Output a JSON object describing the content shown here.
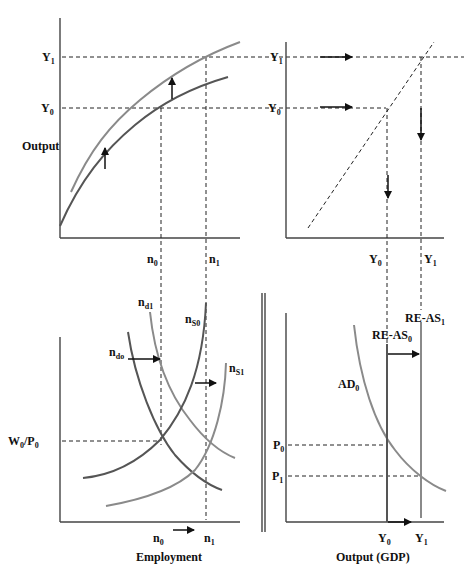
{
  "panels": {
    "production_function": {
      "y_axis_label": "Output",
      "y_ticks": [
        {
          "main": "Y",
          "sub": "1"
        },
        {
          "main": "Y",
          "sub": "0"
        }
      ],
      "x_ticks": [
        {
          "main": "n",
          "sub": "0"
        },
        {
          "main": "n",
          "sub": "1"
        }
      ],
      "curves": [
        "production function (initial)",
        "production function (shifted up)"
      ]
    },
    "forty_five_degree": {
      "y_ticks": [
        {
          "main": "Y",
          "sub": "1"
        },
        {
          "main": "Y",
          "sub": "0"
        }
      ],
      "x_ticks": [
        {
          "main": "Y",
          "sub": "0"
        },
        {
          "main": "Y",
          "sub": "1"
        }
      ]
    },
    "labor_market": {
      "x_axis_label": "Employment",
      "y_ticks": [
        {
          "main": "W",
          "sub": "0",
          "main2": "/P",
          "sub2": "0"
        }
      ],
      "x_ticks": [
        {
          "main": "n",
          "sub": "0"
        },
        {
          "main": "n",
          "sub": "1"
        }
      ],
      "curve_labels": {
        "nd0": {
          "main": "n",
          "sub": "do"
        },
        "nd1": {
          "main": "n",
          "sub": "d1"
        },
        "ns0": {
          "main": "n",
          "sub": "S0"
        },
        "ns1": {
          "main": "n",
          "sub": "S1"
        }
      }
    },
    "ad_as": {
      "x_axis_label": "Output (GDP)",
      "y_ticks": [
        {
          "main": "P",
          "sub": "0"
        },
        {
          "main": "P",
          "sub": "1"
        }
      ],
      "x_ticks": [
        {
          "main": "Y",
          "sub": "0"
        },
        {
          "main": "Y",
          "sub": "1"
        }
      ],
      "curve_labels": {
        "ad0": {
          "main": "AD",
          "sub": "0"
        },
        "reas0": {
          "main": "RE-AS",
          "sub": "0"
        },
        "reas1": {
          "main": "RE-AS",
          "sub": "1"
        }
      }
    }
  },
  "colors": {
    "dark_curve": "#555555",
    "light_curve": "#8a8a8a",
    "axis": "#444444",
    "text": "#111111"
  }
}
